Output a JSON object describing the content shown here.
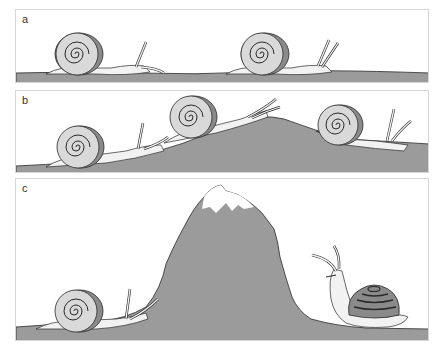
{
  "figure": {
    "colors": {
      "ground": "#9b9b9b",
      "shell": "#d9d9d9",
      "shell_dark": "#8a8a8a",
      "body": "#f2f2f2",
      "outline": "#2a2a2a",
      "snow": "#ffffff",
      "border": "#d6d6d6"
    },
    "panels": [
      {
        "label": "a",
        "scene": "two snails crawling on flat ground"
      },
      {
        "label": "b",
        "scene": "three snails crawling over a rounded hill"
      },
      {
        "label": "c",
        "scene": "snail approaching a tall snow-capped mountain; a second snail with dark conical shell looks up on the other side"
      }
    ]
  }
}
